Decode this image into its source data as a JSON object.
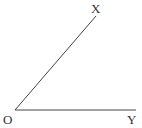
{
  "diagram": {
    "type": "angle",
    "title": "",
    "points": {
      "O": {
        "label": "O",
        "x": 15,
        "y": 110
      },
      "X": {
        "label": "X",
        "x": 96,
        "y": 16
      },
      "Y": {
        "label": "Y",
        "x": 136,
        "y": 110
      }
    },
    "labels": {
      "vertex": "O",
      "ray1_end": "X",
      "ray2_end": "Y"
    },
    "rays": [
      {
        "from": "O",
        "to": "X"
      },
      {
        "from": "O",
        "to": "Y"
      }
    ],
    "colors": {
      "stroke": "#444444",
      "text": "#333333",
      "background": "#ffffff"
    }
  }
}
